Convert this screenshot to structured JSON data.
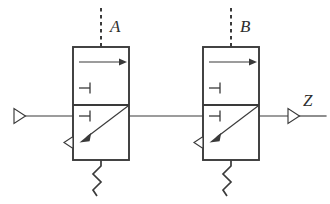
{
  "figure": {
    "background_color": "#ffffff",
    "line_color": "#3a3a3a",
    "width": 330,
    "height": 204
  },
  "labels": {
    "control_a": "A",
    "control_b": "B",
    "output_z": "Z"
  },
  "stages": [
    {
      "name": "stage-a",
      "control_label": "A",
      "box": {
        "x": 73,
        "y": 47,
        "width": 56,
        "height": 113
      },
      "divider_y": 105,
      "top_arrow": {
        "from_x": 79,
        "to_x": 126,
        "y": 62
      },
      "upper_stub": {
        "x": 79,
        "to_x": 90,
        "y": 88
      },
      "lower_stub": {
        "x": 79,
        "to_x": 90,
        "y": 116
      },
      "diagonal_arrow": {
        "from_x": 128,
        "from_y": 106,
        "to_x": 80,
        "to_y": 142
      },
      "output_triangle": {
        "x": 73,
        "y": 142,
        "direction": "left"
      },
      "squiggle": {
        "x": 101,
        "y_top": 160,
        "y_bottom": 196
      }
    },
    {
      "name": "stage-b",
      "control_label": "B",
      "box": {
        "x": 203,
        "y": 47,
        "width": 56,
        "height": 113
      },
      "divider_y": 105,
      "top_arrow": {
        "from_x": 209,
        "to_x": 256,
        "y": 62
      },
      "upper_stub": {
        "x": 209,
        "to_x": 220,
        "y": 88
      },
      "lower_stub": {
        "x": 209,
        "to_x": 220,
        "y": 116
      },
      "diagonal_arrow": {
        "from_x": 258,
        "from_y": 106,
        "to_x": 210,
        "to_y": 142
      },
      "output_triangle": {
        "x": 203,
        "y": 142,
        "direction": "left"
      },
      "squiggle": {
        "x": 231,
        "y_top": 160,
        "y_bottom": 196
      }
    }
  ],
  "nets": {
    "input_wire": {
      "from_x": 24,
      "to_x": 73,
      "y": 116
    },
    "input_triangle": {
      "x": 14,
      "y": 116,
      "direction": "right"
    },
    "mid_wire": {
      "from_x": 129,
      "to_x": 203,
      "y": 116
    },
    "output_wire": {
      "from_x": 259,
      "to_x": 288,
      "y": 116
    },
    "output_triangle": {
      "x": 288,
      "y": 116,
      "direction": "right"
    },
    "output_tail": {
      "from_x": 298,
      "to_x": 326,
      "y": 116
    }
  },
  "icons": {
    "input_buffer": "triangle-right-icon",
    "output_buffer": "triangle-right-icon",
    "stage_output_buffer": "triangle-left-icon",
    "ground_squiggle": "zigzag-icon",
    "control_line": "dashed-line-icon",
    "signal_arrow": "arrow-right-icon",
    "pass_arrow": "arrow-diagonal-icon"
  }
}
